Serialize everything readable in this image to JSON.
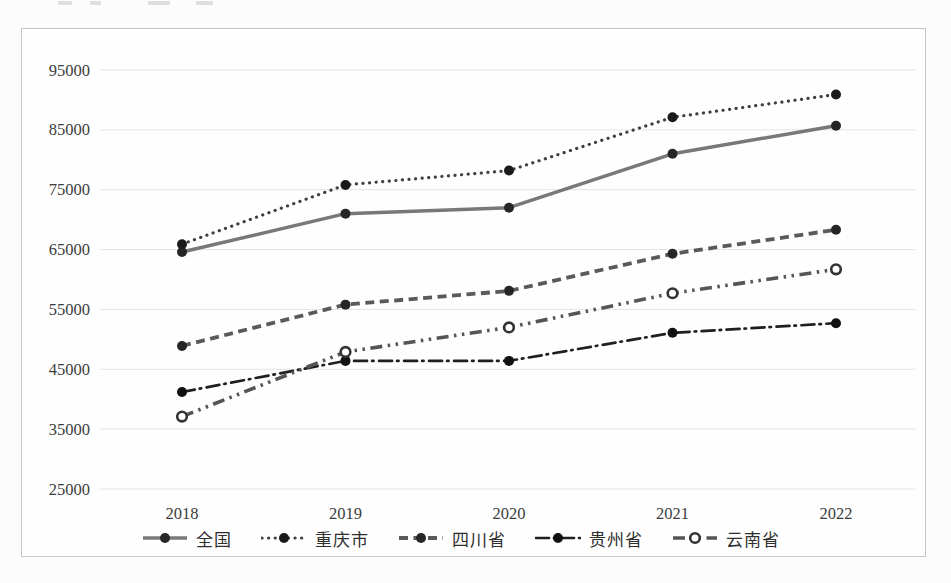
{
  "page": {
    "background_color": "#fcfcfc",
    "frame_border_color": "#c6c6c6",
    "grid_color": "#e4e4e4",
    "axis_text_color": "#3c3c3c"
  },
  "chart_data": {
    "type": "line",
    "title": "",
    "xlabel": "",
    "ylabel": "",
    "categories": [
      "2018",
      "2019",
      "2020",
      "2021",
      "2022"
    ],
    "y_ticks": [
      95000,
      85000,
      75000,
      65000,
      55000,
      45000,
      35000,
      25000
    ],
    "ylim": [
      25000,
      95000
    ],
    "grid": "horizontal",
    "legend_position": "bottom",
    "series": [
      {
        "key": "national",
        "name": "全国",
        "values": [
          64600,
          71000,
          72000,
          81000,
          85700
        ],
        "style": "solid",
        "width": 3.4,
        "color": "#787878",
        "marker": "filled",
        "marker_color": "#262626"
      },
      {
        "key": "chongqing",
        "name": "重庆市",
        "values": [
          65900,
          75800,
          78200,
          87100,
          90900
        ],
        "style": "dotted",
        "width": 3.2,
        "color": "#3f3f3f",
        "marker": "filled",
        "marker_color": "#1a1a1a"
      },
      {
        "key": "sichuan",
        "name": "四川省",
        "values": [
          48900,
          55800,
          58100,
          64300,
          68300
        ],
        "style": "dashed",
        "width": 3.8,
        "color": "#5a5a5a",
        "marker": "filled",
        "marker_color": "#262626"
      },
      {
        "key": "guizhou",
        "name": "贵州省",
        "values": [
          41200,
          46400,
          46400,
          51100,
          52700
        ],
        "style": "dashdot",
        "width": 2.7,
        "color": "#1f1f1f",
        "marker": "filled",
        "marker_color": "#111111"
      },
      {
        "key": "yunnan",
        "name": "云南省",
        "values": [
          37100,
          47900,
          52000,
          57700,
          61700
        ],
        "style": "dashdotdot",
        "width": 3.6,
        "color": "#555555",
        "marker": "open",
        "marker_color": "#333333"
      }
    ]
  }
}
